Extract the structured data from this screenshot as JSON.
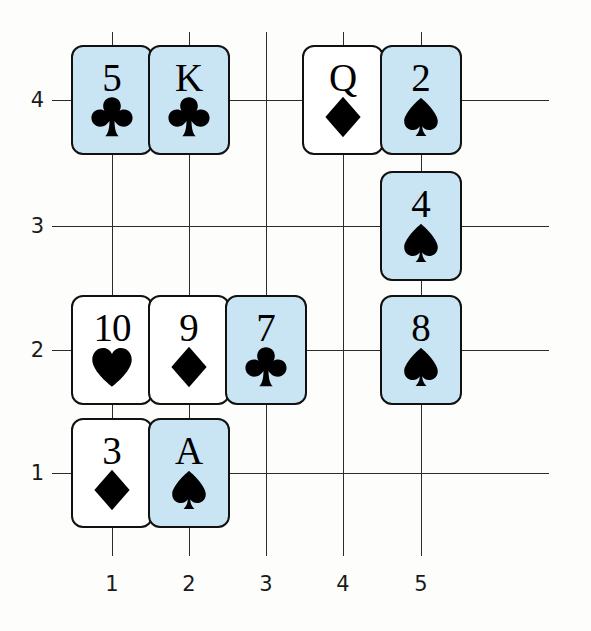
{
  "chart_data": {
    "type": "scatter",
    "title": "",
    "xlabel": "",
    "ylabel": "",
    "xlim": [
      0.5,
      5.5
    ],
    "ylim": [
      0.5,
      4.5
    ],
    "grid": true,
    "legend": "none",
    "x_ticks": [
      "1",
      "2",
      "3",
      "4",
      "5"
    ],
    "y_ticks": [
      "1",
      "2",
      "3",
      "4"
    ],
    "point_marker": "playing-card",
    "highlight_color": "#c9e4f3",
    "plain_color": "#ffffff",
    "points": [
      {
        "x": 1,
        "y": 4,
        "rank": "5",
        "suit": "clubs",
        "suit_glyph": "♣",
        "highlighted": true
      },
      {
        "x": 2,
        "y": 4,
        "rank": "K",
        "suit": "clubs",
        "suit_glyph": "♣",
        "highlighted": true
      },
      {
        "x": 4,
        "y": 4,
        "rank": "Q",
        "suit": "diamonds",
        "suit_glyph": "♦",
        "highlighted": false
      },
      {
        "x": 5,
        "y": 4,
        "rank": "2",
        "suit": "spades",
        "suit_glyph": "♠",
        "highlighted": true
      },
      {
        "x": 5,
        "y": 3,
        "rank": "4",
        "suit": "spades",
        "suit_glyph": "♠",
        "highlighted": true
      },
      {
        "x": 1,
        "y": 2,
        "rank": "10",
        "suit": "hearts",
        "suit_glyph": "♥",
        "highlighted": false
      },
      {
        "x": 2,
        "y": 2,
        "rank": "9",
        "suit": "diamonds",
        "suit_glyph": "♦",
        "highlighted": false
      },
      {
        "x": 3,
        "y": 2,
        "rank": "7",
        "suit": "clubs",
        "suit_glyph": "♣",
        "highlighted": true
      },
      {
        "x": 5,
        "y": 2,
        "rank": "8",
        "suit": "spades",
        "suit_glyph": "♠",
        "highlighted": true
      },
      {
        "x": 1,
        "y": 1,
        "rank": "3",
        "suit": "diamonds",
        "suit_glyph": "♦",
        "highlighted": false
      },
      {
        "x": 2,
        "y": 1,
        "rank": "A",
        "suit": "spades",
        "suit_glyph": "♠",
        "highlighted": true
      }
    ]
  },
  "geometry": {
    "x_px": {
      "1": 112,
      "2": 189,
      "3": 266,
      "4": 343,
      "5": 421
    },
    "y_px": {
      "1": 473,
      "2": 350,
      "3": 226,
      "4": 100
    },
    "hline_x0": 52,
    "hline_x1": 549,
    "vline_y0": 32,
    "vline_y1": 556,
    "xlabel_y": 572,
    "ylabel_x": 18
  }
}
